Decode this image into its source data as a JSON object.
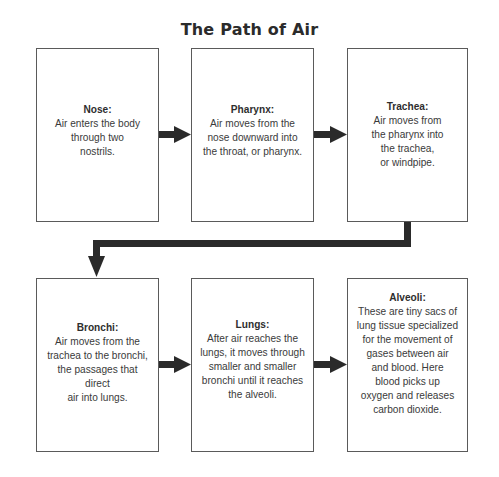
{
  "diagram": {
    "title": "The Path of Air",
    "colors": {
      "box_border": "#5a5a5a",
      "arrow": "#2a2a2a",
      "text": "#333333"
    },
    "steps": [
      {
        "heading": "Nose:",
        "lines": [
          "Air enters the body",
          "through two",
          "nostrils."
        ]
      },
      {
        "heading": "Pharynx:",
        "lines": [
          "Air moves from the",
          "nose downward into",
          "the throat, or pharynx."
        ]
      },
      {
        "heading": "Trachea:",
        "lines": [
          "Air moves from",
          "the pharynx into",
          "the trachea,",
          "or windpipe."
        ]
      },
      {
        "heading": "Bronchi:",
        "lines": [
          "Air moves from the",
          "trachea to the bronchi,",
          "the passages that direct",
          "air into lungs."
        ]
      },
      {
        "heading": "Lungs:",
        "lines": [
          "After air reaches the",
          "lungs, it moves through",
          "smaller and smaller",
          "bronchi until it reaches",
          "the alveoli."
        ]
      },
      {
        "heading": "Alveoli:",
        "lines": [
          "These are tiny sacs of",
          "lung tissue specialized",
          "for the movement of",
          "gases between air",
          "and blood. Here",
          "blood picks up",
          "oxygen and releases",
          "carbon dioxide."
        ]
      }
    ],
    "connections": [
      {
        "from": "Nose",
        "to": "Pharynx"
      },
      {
        "from": "Pharynx",
        "to": "Trachea"
      },
      {
        "from": "Trachea",
        "to": "Bronchi"
      },
      {
        "from": "Bronchi",
        "to": "Lungs"
      },
      {
        "from": "Lungs",
        "to": "Alveoli"
      }
    ]
  }
}
